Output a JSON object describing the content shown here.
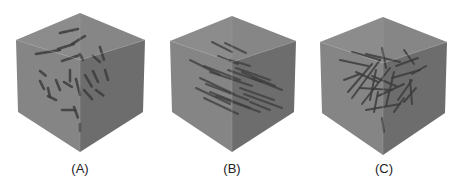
{
  "figure": {
    "panels": [
      {
        "id": "A",
        "label": "(A)",
        "label_pos": [
          80,
          170
        ],
        "cube": {
          "top": [
            80,
            13
          ],
          "left": [
            16,
            40
          ],
          "right": [
            145,
            40
          ],
          "center": [
            80,
            60
          ],
          "bottom": [
            80,
            152
          ],
          "left_bottom": [
            18,
            112
          ],
          "right_bottom": [
            143,
            112
          ]
        },
        "fiber_style": "coiled",
        "fibers": [
          [
            60,
            33,
            78,
            29
          ],
          [
            36,
            54,
            60,
            50
          ],
          [
            58,
            49,
            74,
            44
          ],
          [
            72,
            44,
            85,
            36
          ],
          [
            62,
            61,
            80,
            55
          ],
          [
            40,
            71,
            46,
            76
          ],
          [
            40,
            81,
            44,
            89
          ],
          [
            48,
            88,
            50,
            97
          ],
          [
            56,
            80,
            60,
            90
          ],
          [
            64,
            82,
            72,
            87
          ],
          [
            70,
            70,
            70,
            82
          ],
          [
            80,
            54,
            83,
            60
          ],
          [
            93,
            56,
            100,
            62
          ],
          [
            100,
            47,
            104,
            60
          ],
          [
            105,
            70,
            108,
            80
          ],
          [
            93,
            71,
            98,
            82
          ],
          [
            85,
            75,
            92,
            87
          ],
          [
            96,
            90,
            104,
            96
          ],
          [
            76,
            79,
            80,
            95
          ],
          [
            62,
            110,
            76,
            110
          ],
          [
            74,
            107,
            78,
            118
          ],
          [
            80,
            124,
            80,
            131
          ],
          [
            48,
            96,
            56,
            100
          ],
          [
            84,
            90,
            92,
            99
          ]
        ]
      },
      {
        "id": "B",
        "label": "(B)",
        "label_pos": [
          232,
          170
        ],
        "cube": {
          "top": [
            232,
            16
          ],
          "left": [
            170,
            41
          ],
          "right": [
            296,
            41
          ],
          "center": [
            232,
            62
          ],
          "bottom": [
            232,
            152
          ],
          "left_bottom": [
            172,
            112
          ],
          "right_bottom": [
            294,
            112
          ]
        },
        "fiber_style": "aligned",
        "fibers": [
          [
            212,
            42,
            232,
            52
          ],
          [
            225,
            43,
            246,
            53
          ],
          [
            190,
            60,
            220,
            75
          ],
          [
            204,
            66,
            240,
            80
          ],
          [
            210,
            72,
            252,
            86
          ],
          [
            228,
            70,
            262,
            82
          ],
          [
            236,
            68,
            270,
            80
          ],
          [
            242,
            72,
            275,
            86
          ],
          [
            200,
            78,
            234,
            94
          ],
          [
            206,
            84,
            248,
            100
          ],
          [
            196,
            88,
            230,
            104
          ],
          [
            210,
            92,
            250,
            108
          ],
          [
            216,
            96,
            260,
            112
          ],
          [
            240,
            88,
            274,
            100
          ],
          [
            244,
            94,
            282,
            108
          ],
          [
            252,
            78,
            282,
            90
          ],
          [
            230,
            60,
            250,
            66
          ],
          [
            218,
            56,
            238,
            64
          ],
          [
            204,
            98,
            238,
            114
          ],
          [
            250,
            102,
            270,
            110
          ]
        ]
      },
      {
        "id": "C",
        "label": "(C)",
        "label_pos": [
          384,
          170
        ],
        "cube": {
          "top": [
            383,
            17
          ],
          "left": [
            320,
            42
          ],
          "right": [
            447,
            42
          ],
          "center": [
            383,
            63
          ],
          "bottom": [
            383,
            155
          ],
          "left_bottom": [
            322,
            113
          ],
          "right_bottom": [
            445,
            113
          ]
        },
        "fiber_style": "random",
        "fibers": [
          [
            340,
            60,
            368,
            66
          ],
          [
            352,
            52,
            380,
            60
          ],
          [
            366,
            54,
            400,
            62
          ],
          [
            382,
            48,
            386,
            68
          ],
          [
            404,
            50,
            414,
            64
          ],
          [
            356,
            72,
            378,
            82
          ],
          [
            348,
            92,
            372,
            64
          ],
          [
            352,
            98,
            380,
            60
          ],
          [
            362,
            104,
            390,
            68
          ],
          [
            370,
            100,
            376,
            70
          ],
          [
            378,
            96,
            404,
            84
          ],
          [
            386,
            106,
            394,
            72
          ],
          [
            398,
            100,
            412,
            80
          ],
          [
            410,
            80,
            412,
            104
          ],
          [
            392,
            78,
            420,
            70
          ],
          [
            396,
            66,
            418,
            58
          ],
          [
            360,
            88,
            392,
            90
          ],
          [
            366,
            110,
            400,
            104
          ],
          [
            374,
            112,
            378,
            92
          ],
          [
            394,
            112,
            404,
            98
          ],
          [
            404,
            102,
            416,
            88
          ],
          [
            382,
            118,
            384,
            132
          ],
          [
            372,
            76,
            396,
            86
          ],
          [
            344,
            80,
            360,
            74
          ],
          [
            412,
            74,
            426,
            66
          ]
        ]
      }
    ]
  },
  "colors": {
    "background": "#ffffff",
    "face_top": "#8c8c8c",
    "face_left": "#858585",
    "face_right": "#727272",
    "edge": "#9a9a9a",
    "fiber": "#3c3c3c",
    "label": "#222222"
  }
}
